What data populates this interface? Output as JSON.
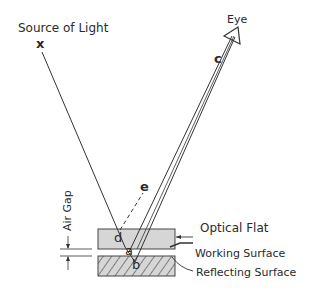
{
  "diagram": {
    "labels": {
      "source": "Source of Light",
      "source_marker": "x",
      "eye": "Eye",
      "point_c": "c",
      "point_e": "e",
      "point_d": "d",
      "point_a": "a",
      "point_b": "b",
      "air_gap": "Air Gap",
      "optical_flat": "Optical Flat",
      "working_surface": "Working Surface",
      "reflecting_surface": "Reflecting Surface"
    },
    "colors": {
      "line": "#333333",
      "flat_fill": "#d6d6d6",
      "hatch": "#333333"
    }
  }
}
